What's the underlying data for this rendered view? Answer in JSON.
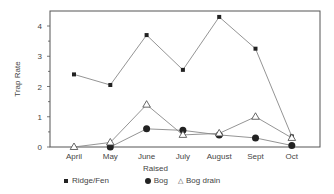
{
  "chart_data": {
    "type": "line",
    "title": "",
    "xlabel": "",
    "ylabel": "Trap Rate",
    "categories": [
      "April",
      "May",
      "June",
      "July",
      "August",
      "Sept",
      "Oct"
    ],
    "ylim": [
      0,
      4.5
    ],
    "yticks": [
      0,
      1,
      2,
      3,
      4
    ],
    "grid": false,
    "legend_position": "bottom",
    "series": [
      {
        "name": "Ridge/Fen",
        "marker": "square",
        "values": [
          2.4,
          2.05,
          3.7,
          2.55,
          4.3,
          3.25,
          0.35
        ]
      },
      {
        "name": "Raised Bog",
        "marker": "filled-circle",
        "values": [
          null,
          0.0,
          0.6,
          0.55,
          0.4,
          0.3,
          0.05
        ]
      },
      {
        "name": "Bog drain",
        "marker": "open-triangle",
        "values": [
          0.0,
          0.15,
          1.4,
          0.4,
          0.45,
          1.0,
          0.3
        ]
      }
    ]
  },
  "legend": {
    "ridge_fen": "Ridge/Fen",
    "raised_bog_line1": "Raised",
    "raised_bog_line2": "Bog",
    "bog_drain": "Bog drain"
  },
  "colors": {
    "line": "#888888",
    "marker": "#222222",
    "axis": "#555555"
  }
}
